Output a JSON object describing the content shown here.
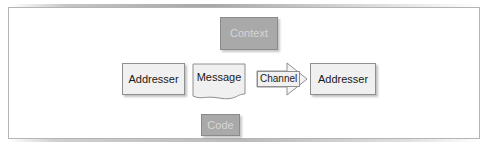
{
  "diagram": {
    "frame": {
      "border_color": "#b4b4b4",
      "background": "#ffffff"
    },
    "palette": {
      "light_fill": "#f0f0f0",
      "light_border": "#8f8f8f",
      "grey_fill": "#a9a9a9",
      "grey_border": "#8a8a8a",
      "grey_text": "#d6d6d6",
      "dark_text": "#1a1a1a"
    },
    "nodes": [
      {
        "id": "context",
        "label": "Context",
        "shape": "rectangle",
        "style": "grey-filled"
      },
      {
        "id": "addresser_left",
        "label": "Addresser",
        "shape": "rectangle",
        "style": "light-filled"
      },
      {
        "id": "message",
        "label": "Message",
        "shape": "document",
        "style": "light-filled"
      },
      {
        "id": "channel",
        "label": "Channel",
        "shape": "right-arrow",
        "style": "light-filled"
      },
      {
        "id": "addresser_right",
        "label": "Addresser",
        "shape": "rectangle",
        "style": "light-filled"
      },
      {
        "id": "code",
        "label": "Code",
        "shape": "rectangle",
        "style": "grey-filled"
      }
    ]
  }
}
